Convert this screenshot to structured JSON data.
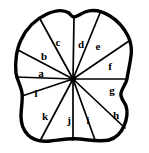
{
  "figure": {
    "type": "sector-partition-diagram",
    "background_color": "#ffffff",
    "line_color": "#000000",
    "outline_stroke_width": 3.4,
    "spoke_stroke_width": 1.7,
    "center": {
      "x": 73,
      "y": 79
    },
    "canvas": {
      "width": 149,
      "height": 153
    },
    "outline_path": "M 21,40 C 27,27 36,19 47,14 C 56,10 63,9 69,13 C 71,15 72,17 74,17 C 77,17 80,14 85,12 C 93,9 102,11 110,16 C 118,21 124,28 128,36 C 131,42 132,49 131,56 C 130,64 128,72 127,79 C 126,84 122,88 121,93 C 120,98 124,101 126,106 C 128,112 127,119 124,126 C 121,133 116,138 109,140 C 100,142 90,140 80,139 C 70,138 60,140 50,141 C 41,142 33,140 28,135 C 23,130 21,123 21,116 C 21,108 23,100 22,93 C 21,86 17,80 16,73 C 15,64 16,50 21,40 Z",
    "spokes": [
      {
        "name": "spoke-left-horizontal",
        "x": 16,
        "y": 77
      },
      {
        "name": "spoke-upper-left-1",
        "x": 18,
        "y": 50
      },
      {
        "name": "spoke-upper-left-2",
        "x": 40,
        "y": 19
      },
      {
        "name": "spoke-top-vertical",
        "x": 74,
        "y": 17
      },
      {
        "name": "spoke-upper-right-1",
        "x": 100,
        "y": 13
      },
      {
        "name": "spoke-upper-right-2",
        "x": 129,
        "y": 41
      },
      {
        "name": "spoke-right-horizontal",
        "x": 127,
        "y": 79
      },
      {
        "name": "spoke-lower-right-1",
        "x": 125,
        "y": 128
      },
      {
        "name": "spoke-lower-right-2",
        "x": 95,
        "y": 140
      },
      {
        "name": "spoke-bottom-vertical",
        "x": 73,
        "y": 140
      },
      {
        "name": "spoke-lower-left-1",
        "x": 40,
        "y": 141
      },
      {
        "name": "spoke-lower-left-2",
        "x": 22,
        "y": 96
      }
    ],
    "sectors": [
      {
        "id": "a",
        "label": "a",
        "label_x": 41,
        "label_y": 73
      },
      {
        "id": "b",
        "label": "b",
        "label_x": 44,
        "label_y": 56
      },
      {
        "id": "c",
        "label": "c",
        "label_x": 58,
        "label_y": 42
      },
      {
        "id": "d",
        "label": "d",
        "label_x": 81,
        "label_y": 44
      },
      {
        "id": "e",
        "label": "e",
        "label_x": 98,
        "label_y": 46
      },
      {
        "id": "f",
        "label": "f",
        "label_x": 110,
        "label_y": 66
      },
      {
        "id": "g",
        "label": "g",
        "label_x": 112,
        "label_y": 90
      },
      {
        "id": "h",
        "label": "h",
        "label_x": 116,
        "label_y": 115
      },
      {
        "id": "i",
        "label": "i",
        "label_x": 88,
        "label_y": 120
      },
      {
        "id": "j",
        "label": "j",
        "label_x": 69,
        "label_y": 120
      },
      {
        "id": "k",
        "label": "k",
        "label_x": 45,
        "label_y": 116
      },
      {
        "id": "l",
        "label": "l",
        "label_x": 36,
        "label_y": 93
      }
    ]
  }
}
